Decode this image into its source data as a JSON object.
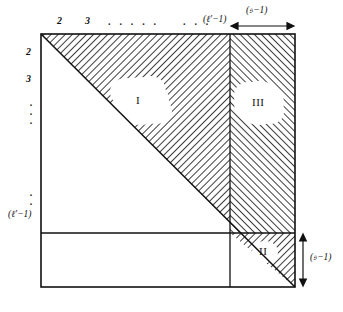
{
  "figure": {
    "type": "mathematical-region-diagram",
    "frame": {
      "left": 41,
      "top": 34,
      "right": 295,
      "bottom": 287
    },
    "dividers": {
      "vertical_x": 230,
      "horizontal_y": 233
    },
    "diagonal": {
      "from": [
        41,
        34
      ],
      "to": [
        295,
        287
      ]
    }
  },
  "top_axis": {
    "ticks": [
      "2",
      "3"
    ],
    "dots_middle": ". . . . .",
    "dots_before_label": ". . .",
    "end_label": "(ℓ′−1)"
  },
  "left_axis": {
    "ticks": [
      "2",
      "3"
    ],
    "dots": ".\n.\n.",
    "end_label": "(ℓ′−1)"
  },
  "brackets": {
    "top_right": {
      "label": "(𝔰−1)",
      "from_x": 230,
      "to_x": 295
    },
    "bottom_right": {
      "label": "(𝔰−1)",
      "from_y": 233,
      "to_y": 287
    }
  },
  "regions": [
    {
      "id": "I",
      "label": "I",
      "hatch": "diagonal-down-right",
      "center": [
        141,
        101
      ]
    },
    {
      "id": "II",
      "label": "II",
      "hatch": "diagonal-down-right",
      "center": [
        264,
        252
      ]
    },
    {
      "id": "III",
      "label": "III",
      "hatch": "diagonal-down-left",
      "center": [
        259,
        103
      ]
    }
  ],
  "colors": {
    "ink": "#111111",
    "hatch": "#3a3a3a",
    "paper": "#ffffff",
    "blob": "#ffffff"
  }
}
